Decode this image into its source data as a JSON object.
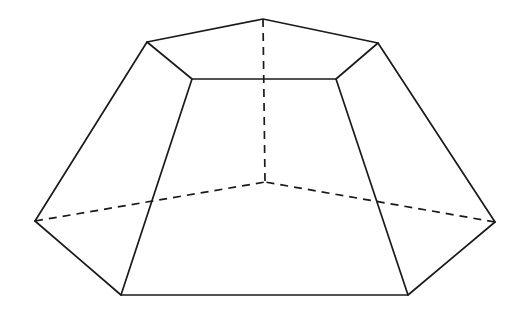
{
  "figure": {
    "name": "pentagonal-frustum",
    "canvas": {
      "width": 521,
      "height": 316
    },
    "style": {
      "background_color": "#ffffff",
      "solid_stroke_color": "#1a1a1a",
      "hidden_stroke_color": "#1a1a1a",
      "face_fill_color": "#ffffff",
      "solid_stroke_width": 1.7,
      "hidden_stroke_width": 1.7,
      "hidden_dash_pattern": "8,6"
    },
    "vertices": {
      "top_apex": {
        "label": "A",
        "x": 263,
        "y": 19
      },
      "top_upper_left": {
        "label": "B",
        "x": 147,
        "y": 42
      },
      "top_upper_right": {
        "label": "C",
        "x": 378,
        "y": 43
      },
      "top_front_left": {
        "label": "D",
        "x": 192,
        "y": 79
      },
      "top_front_right": {
        "label": "E",
        "x": 336,
        "y": 79
      },
      "bottom_far_left": {
        "label": "F",
        "x": 35,
        "y": 221
      },
      "bottom_far_right": {
        "label": "G",
        "x": 495,
        "y": 222
      },
      "bottom_front_left": {
        "label": "H",
        "x": 121,
        "y": 295
      },
      "bottom_front_right": {
        "label": "I",
        "x": 408,
        "y": 295
      },
      "bottom_back_center": {
        "label": "J",
        "x": 265,
        "y": 182
      }
    },
    "edges": {
      "top_face_visible": [
        {
          "name": "top-edge-apex-to-upper-left",
          "from": "top_apex",
          "to": "top_upper_left",
          "visible": true
        },
        {
          "name": "top-edge-apex-to-upper-right",
          "from": "top_apex",
          "to": "top_upper_right",
          "visible": true
        },
        {
          "name": "top-edge-upper-left-to-front-left",
          "from": "top_upper_left",
          "to": "top_front_left",
          "visible": true
        },
        {
          "name": "top-edge-upper-right-to-front-right",
          "from": "top_upper_right",
          "to": "top_front_right",
          "visible": true
        },
        {
          "name": "top-edge-front-left-to-front-right",
          "from": "top_front_left",
          "to": "top_front_right",
          "visible": true
        }
      ],
      "bottom_face": [
        {
          "name": "bottom-edge-front-left-to-front-right",
          "from": "bottom_front_left",
          "to": "bottom_front_right",
          "visible": true
        },
        {
          "name": "bottom-edge-far-left-to-front-left",
          "from": "bottom_far_left",
          "to": "bottom_front_left",
          "visible": true
        },
        {
          "name": "bottom-edge-far-right-to-front-right",
          "from": "bottom_far_right",
          "to": "bottom_front_right",
          "visible": true
        },
        {
          "name": "bottom-edge-far-left-to-back-center",
          "from": "bottom_far_left",
          "to": "bottom_back_center",
          "visible": false
        },
        {
          "name": "bottom-edge-far-right-to-back-center",
          "from": "bottom_far_right",
          "to": "bottom_back_center",
          "visible": false
        }
      ],
      "lateral": [
        {
          "name": "lateral-edge-upper-left",
          "from": "top_upper_left",
          "to": "bottom_far_left",
          "visible": true
        },
        {
          "name": "lateral-edge-upper-right",
          "from": "top_upper_right",
          "to": "bottom_far_right",
          "visible": true
        },
        {
          "name": "lateral-edge-front-left",
          "from": "top_front_left",
          "to": "bottom_front_left",
          "visible": true
        },
        {
          "name": "lateral-edge-front-right",
          "from": "top_front_right",
          "to": "bottom_front_right",
          "visible": true
        }
      ],
      "axis": [
        {
          "name": "hidden-vertical-axis",
          "from": "top_apex",
          "to": "bottom_back_center",
          "visible": false
        }
      ]
    },
    "polygon_paths": {
      "top_face": "M 263,19 L 378,43 L 336,79 L 192,79 L 147,42 Z",
      "left_face": "M 147,42 L 192,79 L 121,295 L 35,221 Z",
      "front_face": "M 192,79 L 336,79 L 408,295 L 121,295 Z",
      "right_face": "M 378,43 L 495,222 L 408,295 L 336,79 Z",
      "top_face_outline": "M 263,19 L 378,43 L 336,79 L 192,79 L 147,42 Z",
      "lateral_left": "M 147,42 L 35,221",
      "lateral_right": "M 378,43 L 495,222",
      "lateral_front_left": "M 192,79 L 121,295",
      "lateral_front_right": "M 336,79 L 408,295",
      "bottom_visible": "M 35,221 L 121,295 L 408,295 L 495,222",
      "bottom_hidden_left": "M 35,221 L 265,182",
      "bottom_hidden_right": "M 495,222 L 265,182",
      "vertical_axis": "M 263,19 L 265,182"
    }
  }
}
